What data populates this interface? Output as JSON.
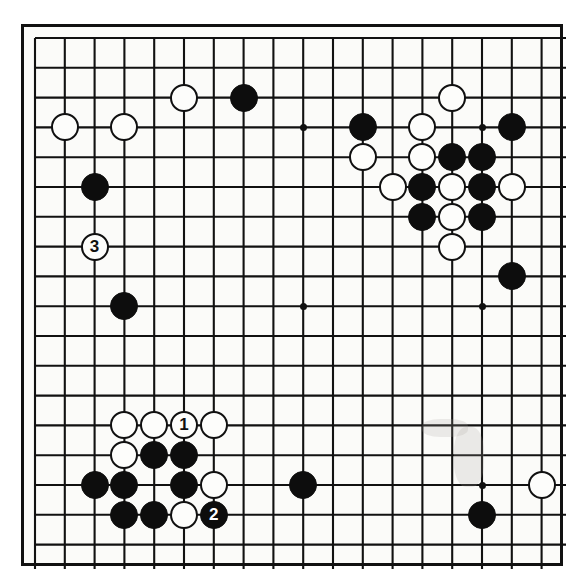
{
  "diagram": {
    "type": "go-board",
    "size": 19,
    "board_color": "#fbfbf9",
    "line_color": "#111111",
    "black_color": "#0d0d0d",
    "white_color": "#fdfdfb",
    "grid_origin_px": 11,
    "grid_spacing_px": 29.8,
    "hoshi_points": [
      {
        "col": 3,
        "row": 3
      },
      {
        "col": 9,
        "row": 3
      },
      {
        "col": 15,
        "row": 3
      },
      {
        "col": 3,
        "row": 9
      },
      {
        "col": 9,
        "row": 9
      },
      {
        "col": 15,
        "row": 9
      },
      {
        "col": 3,
        "row": 15
      },
      {
        "col": 9,
        "row": 15
      },
      {
        "col": 15,
        "row": 15
      }
    ],
    "stones": [
      {
        "col": 5,
        "row": 2,
        "color": "white",
        "label": ""
      },
      {
        "col": 7,
        "row": 2,
        "color": "black",
        "label": ""
      },
      {
        "col": 14,
        "row": 2,
        "color": "white",
        "label": ""
      },
      {
        "col": 1,
        "row": 3,
        "color": "white",
        "label": ""
      },
      {
        "col": 3,
        "row": 3,
        "color": "white",
        "label": ""
      },
      {
        "col": 11,
        "row": 3,
        "color": "black",
        "label": ""
      },
      {
        "col": 13,
        "row": 3,
        "color": "white",
        "label": ""
      },
      {
        "col": 16,
        "row": 3,
        "color": "black",
        "label": ""
      },
      {
        "col": 11,
        "row": 4,
        "color": "white",
        "label": ""
      },
      {
        "col": 13,
        "row": 4,
        "color": "white",
        "label": ""
      },
      {
        "col": 14,
        "row": 4,
        "color": "black",
        "label": ""
      },
      {
        "col": 15,
        "row": 4,
        "color": "black",
        "label": ""
      },
      {
        "col": 2,
        "row": 5,
        "color": "black",
        "label": ""
      },
      {
        "col": 12,
        "row": 5,
        "color": "white",
        "label": ""
      },
      {
        "col": 13,
        "row": 5,
        "color": "black",
        "label": ""
      },
      {
        "col": 14,
        "row": 5,
        "color": "white",
        "label": ""
      },
      {
        "col": 15,
        "row": 5,
        "color": "black",
        "label": ""
      },
      {
        "col": 16,
        "row": 5,
        "color": "white",
        "label": ""
      },
      {
        "col": 13,
        "row": 6,
        "color": "black",
        "label": ""
      },
      {
        "col": 14,
        "row": 6,
        "color": "white",
        "label": ""
      },
      {
        "col": 15,
        "row": 6,
        "color": "black",
        "label": ""
      },
      {
        "col": 2,
        "row": 7,
        "color": "white",
        "label": "3"
      },
      {
        "col": 14,
        "row": 7,
        "color": "white",
        "label": ""
      },
      {
        "col": 16,
        "row": 8,
        "color": "black",
        "label": ""
      },
      {
        "col": 3,
        "row": 9,
        "color": "black",
        "label": ""
      },
      {
        "col": 3,
        "row": 13,
        "color": "white",
        "label": ""
      },
      {
        "col": 4,
        "row": 13,
        "color": "white",
        "label": ""
      },
      {
        "col": 5,
        "row": 13,
        "color": "white",
        "label": "1"
      },
      {
        "col": 6,
        "row": 13,
        "color": "white",
        "label": ""
      },
      {
        "col": 3,
        "row": 14,
        "color": "white",
        "label": ""
      },
      {
        "col": 4,
        "row": 14,
        "color": "black",
        "label": ""
      },
      {
        "col": 5,
        "row": 14,
        "color": "black",
        "label": ""
      },
      {
        "col": 2,
        "row": 15,
        "color": "black",
        "label": ""
      },
      {
        "col": 3,
        "row": 15,
        "color": "black",
        "label": ""
      },
      {
        "col": 5,
        "row": 15,
        "color": "black",
        "label": ""
      },
      {
        "col": 6,
        "row": 15,
        "color": "white",
        "label": ""
      },
      {
        "col": 9,
        "row": 15,
        "color": "black",
        "label": ""
      },
      {
        "col": 17,
        "row": 15,
        "color": "white",
        "label": ""
      },
      {
        "col": 3,
        "row": 16,
        "color": "black",
        "label": ""
      },
      {
        "col": 4,
        "row": 16,
        "color": "black",
        "label": ""
      },
      {
        "col": 5,
        "row": 16,
        "color": "white",
        "label": ""
      },
      {
        "col": 6,
        "row": 16,
        "color": "black",
        "label": "2"
      },
      {
        "col": 15,
        "row": 16,
        "color": "black",
        "label": ""
      }
    ],
    "move_labels": [
      {
        "number": "1",
        "color": "white",
        "col": 5,
        "row": 13
      },
      {
        "number": "2",
        "color": "black",
        "col": 6,
        "row": 16
      },
      {
        "number": "3",
        "color": "white",
        "col": 2,
        "row": 7
      }
    ]
  }
}
